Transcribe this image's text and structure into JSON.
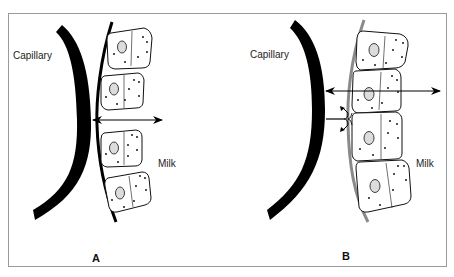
{
  "figure": {
    "panels": [
      {
        "id": "A",
        "letter": "A",
        "capillary_label": "Capillary",
        "milk_label": "Milk",
        "basement_membrane_color": "#000000",
        "pathway": "paracellular (open tight junctions) — bidirectional arrow passes between cells"
      },
      {
        "id": "B",
        "letter": "B",
        "capillary_label": "Capillary",
        "milk_label": "Milk",
        "basement_membrane_color": "#8a8a8a",
        "pathway": "transcellular — bidirectional arrow passes through cell; paracellular route blocked at tight junction"
      }
    ],
    "colors": {
      "capillary": "#000000",
      "cell_outline": "#111111",
      "nucleus_fill": "#dcdcdc",
      "frame": "#9a9a9a"
    }
  }
}
